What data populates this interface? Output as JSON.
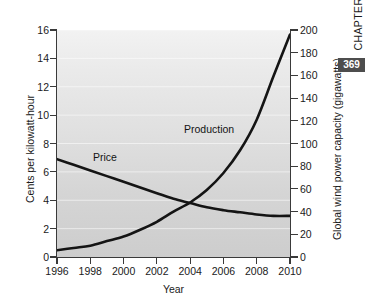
{
  "page": {
    "chapter_word": "CHAPTER",
    "page_number": "369"
  },
  "chart_data": {
    "type": "line",
    "title": "",
    "xlabel": "Year",
    "grid": true,
    "legend_position": "inline-annotation",
    "x": [
      1996,
      1997,
      1998,
      1999,
      2000,
      2001,
      2002,
      2003,
      2004,
      2005,
      2006,
      2007,
      2008,
      2009,
      2010
    ],
    "xlim": [
      1996,
      2010
    ],
    "xticks": [
      "1996",
      "1998",
      "2000",
      "2002",
      "2004",
      "2006",
      "2008",
      "2010"
    ],
    "xtick_values": [
      1996,
      1998,
      2000,
      2002,
      2004,
      2006,
      2008,
      2010
    ],
    "axes": [
      {
        "side": "left",
        "ylabel": "Cents per kilowatt-hour",
        "ylim": [
          0,
          16
        ],
        "yticks": [
          "0",
          "2",
          "4",
          "6",
          "8",
          "10",
          "12",
          "14",
          "16"
        ],
        "ytick_values": [
          0,
          2,
          4,
          6,
          8,
          10,
          12,
          14,
          16
        ]
      },
      {
        "side": "right",
        "ylabel": "Global wind power capacity (gigawatts)",
        "ylim": [
          0,
          200
        ],
        "yticks": [
          "0",
          "20",
          "40",
          "60",
          "80",
          "100",
          "120",
          "140",
          "160",
          "180",
          "200"
        ],
        "ytick_values": [
          0,
          20,
          40,
          60,
          80,
          100,
          120,
          140,
          160,
          180,
          200
        ]
      }
    ],
    "series": [
      {
        "name": "Price",
        "axis": "left",
        "unit": "cents per kilowatt-hour",
        "color": "#141414",
        "values": [
          6.9,
          6.5,
          6.1,
          5.7,
          5.3,
          4.9,
          4.5,
          4.1,
          3.8,
          3.5,
          3.3,
          3.15,
          3.0,
          2.9,
          2.9
        ]
      },
      {
        "name": "Production",
        "axis": "right",
        "unit": "gigawatts",
        "color": "#141414",
        "values": [
          6,
          8,
          10,
          14,
          18,
          24,
          31,
          40,
          48,
          59,
          74,
          94,
          121,
          159,
          196
        ]
      }
    ],
    "annotations": [
      {
        "text": "Price",
        "x": 1998.5,
        "y": 7.6,
        "axis": "left"
      },
      {
        "text": "Production",
        "x": 2002.0,
        "y": 11.4,
        "axis": "left"
      }
    ]
  }
}
